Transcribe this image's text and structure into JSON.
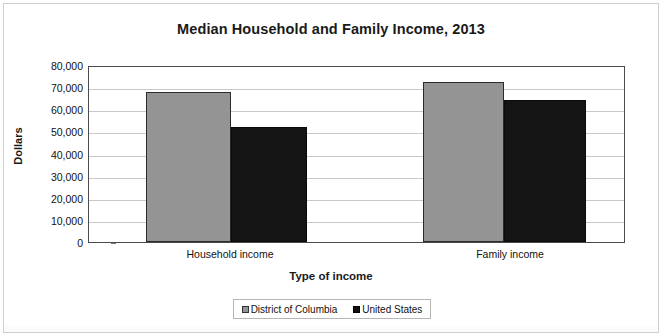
{
  "chart_data": {
    "type": "bar",
    "title": "Median Household and Family Income, 2013",
    "xlabel": "Type of income",
    "ylabel": "Dollars",
    "categories": [
      "Household income",
      "Family income"
    ],
    "series": [
      {
        "name": "District of Columbia",
        "color": "#949494",
        "values": [
          68000,
          72500
        ]
      },
      {
        "name": "United States",
        "color": "#141414",
        "values": [
          52000,
          64000
        ]
      }
    ],
    "ylim": [
      0,
      80000
    ],
    "ytick_values": [
      80000,
      70000,
      60000,
      50000,
      40000,
      30000,
      20000,
      10000,
      0
    ],
    "ytick_labels": [
      "80,000",
      "70,000",
      "60,000",
      "50,000",
      "40,000",
      "30,000",
      "20,000",
      "10,000",
      "0"
    ],
    "grid": true,
    "legend_position": "bottom"
  },
  "legend": {
    "items": [
      {
        "label": "District of Columbia",
        "swatch": "gray-square-icon"
      },
      {
        "label": "United States",
        "swatch": "black-square-icon"
      }
    ]
  }
}
